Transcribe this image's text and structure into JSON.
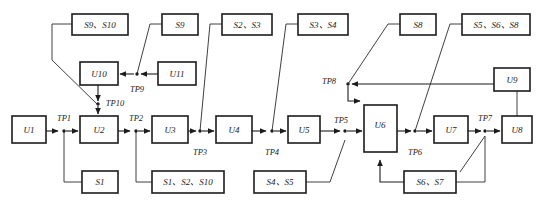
{
  "diagram": {
    "stroke_color": "#1c1c1c",
    "background_color": "#ffffff",
    "width": 544,
    "height": 209,
    "boxes": [
      {
        "id": "b_s9s10",
        "label": "S9、S10",
        "x": 72,
        "y": 14,
        "w": 56,
        "h": 21
      },
      {
        "id": "b_s9",
        "label": "S9",
        "x": 162,
        "y": 14,
        "w": 36,
        "h": 21
      },
      {
        "id": "b_s2s3",
        "label": "S2、S3",
        "x": 222,
        "y": 14,
        "w": 50,
        "h": 21
      },
      {
        "id": "b_s3s4",
        "label": "S3、S4",
        "x": 298,
        "y": 14,
        "w": 50,
        "h": 21
      },
      {
        "id": "b_s8",
        "label": "S8",
        "x": 400,
        "y": 14,
        "w": 36,
        "h": 21
      },
      {
        "id": "b_s5s6s8",
        "label": "S5、S6、S8",
        "x": 462,
        "y": 14,
        "w": 68,
        "h": 21
      },
      {
        "id": "b_u10",
        "label": "U10",
        "x": 80,
        "y": 62,
        "w": 38,
        "h": 23
      },
      {
        "id": "b_u11",
        "label": "U11",
        "x": 158,
        "y": 62,
        "w": 38,
        "h": 23
      },
      {
        "id": "b_u9",
        "label": "U9",
        "x": 494,
        "y": 68,
        "w": 36,
        "h": 23
      },
      {
        "id": "b_u1",
        "label": "U1",
        "x": 12,
        "y": 116,
        "w": 34,
        "h": 27
      },
      {
        "id": "b_u2",
        "label": "U2",
        "x": 80,
        "y": 116,
        "w": 38,
        "h": 27
      },
      {
        "id": "b_u3",
        "label": "U3",
        "x": 152,
        "y": 116,
        "w": 36,
        "h": 27
      },
      {
        "id": "b_u4",
        "label": "U4",
        "x": 216,
        "y": 116,
        "w": 36,
        "h": 27
      },
      {
        "id": "b_u5",
        "label": "U5",
        "x": 288,
        "y": 116,
        "w": 32,
        "h": 27
      },
      {
        "id": "b_u6",
        "label": "U6",
        "x": 364,
        "y": 105,
        "w": 33,
        "h": 47
      },
      {
        "id": "b_u7",
        "label": "U7",
        "x": 434,
        "y": 116,
        "w": 34,
        "h": 27
      },
      {
        "id": "b_u8",
        "label": "U8",
        "x": 502,
        "y": 116,
        "w": 30,
        "h": 27
      },
      {
        "id": "b_s1",
        "label": "S1",
        "x": 82,
        "y": 171,
        "w": 36,
        "h": 22
      },
      {
        "id": "b_s1s2s10",
        "label": "S1、S2、S10",
        "x": 152,
        "y": 171,
        "w": 72,
        "h": 22
      },
      {
        "id": "b_s4s5",
        "label": "S4、S5",
        "x": 254,
        "y": 171,
        "w": 52,
        "h": 22
      },
      {
        "id": "b_s6s7",
        "label": "S6、S7",
        "x": 404,
        "y": 171,
        "w": 52,
        "h": 22
      }
    ],
    "testpoints": [
      {
        "id": "tp1",
        "label": "TP1",
        "x": 64,
        "y": 119,
        "dot_x": 64,
        "dot_y": 131
      },
      {
        "id": "tp2",
        "label": "TP2",
        "x": 136,
        "y": 119,
        "dot_x": 136,
        "dot_y": 131
      },
      {
        "id": "tp3",
        "label": "TP3",
        "x": 200,
        "y": 153,
        "dot_x": 200,
        "dot_y": 131
      },
      {
        "id": "tp4",
        "label": "TP4",
        "x": 272,
        "y": 153,
        "dot_x": 272,
        "dot_y": 131
      },
      {
        "id": "tp5",
        "label": "TP5",
        "x": 341,
        "y": 122,
        "dot_x": 345,
        "dot_y": 131
      },
      {
        "id": "tp6",
        "label": "TP6",
        "x": 415,
        "y": 153,
        "dot_x": 415,
        "dot_y": 131
      },
      {
        "id": "tp7",
        "label": "TP7",
        "x": 485,
        "y": 119,
        "dot_x": 485,
        "dot_y": 131
      },
      {
        "id": "tp8",
        "label": "TP8",
        "x": 329,
        "y": 82,
        "dot_x": 348,
        "dot_y": 84
      },
      {
        "id": "tp9",
        "label": "TP9",
        "x": 137,
        "y": 89,
        "dot_x": 137,
        "dot_y": 74
      },
      {
        "id": "tp10",
        "label": "TP10",
        "x": 113,
        "y": 104,
        "dot_x": 98,
        "dot_y": 105
      }
    ],
    "edges": [
      {
        "id": "e_u1_tp1",
        "from": "U1",
        "to": "TP1"
      },
      {
        "id": "e_tp1_u2",
        "from": "TP1",
        "to": "U2"
      },
      {
        "id": "e_u2_tp2",
        "from": "U2",
        "to": "TP2"
      },
      {
        "id": "e_tp2_u3",
        "from": "TP2",
        "to": "U3"
      },
      {
        "id": "e_u3_tp3",
        "from": "U3",
        "to": "TP3"
      },
      {
        "id": "e_tp3_u4",
        "from": "TP3",
        "to": "U4"
      },
      {
        "id": "e_u4_tp4",
        "from": "U4",
        "to": "TP4"
      },
      {
        "id": "e_tp4_u5",
        "from": "TP4",
        "to": "U5"
      },
      {
        "id": "e_u5_tp5",
        "from": "U5",
        "to": "TP5"
      },
      {
        "id": "e_tp5_u6",
        "from": "TP5",
        "to": "U6"
      },
      {
        "id": "e_u6_tp6",
        "from": "U6",
        "to": "TP6"
      },
      {
        "id": "e_tp6_u7",
        "from": "TP6",
        "to": "U7"
      },
      {
        "id": "e_u7_tp7",
        "from": "U7",
        "to": "TP7"
      },
      {
        "id": "e_tp7_u8",
        "from": "TP7",
        "to": "U8"
      },
      {
        "id": "e_s1_tp1",
        "from": "S1",
        "to": "TP1"
      },
      {
        "id": "e_s1s2s10_tp2",
        "from": "S1、S2、S10",
        "to": "TP2"
      },
      {
        "id": "e_s2s3_tp3",
        "from": "S2、S3",
        "to": "TP3"
      },
      {
        "id": "e_s3s4_tp4",
        "from": "S3、S4",
        "to": "TP4"
      },
      {
        "id": "e_s4s5_tp5",
        "from": "S4、S5",
        "to": "TP5"
      },
      {
        "id": "e_s5s6s8_tp6",
        "from": "S5、S6、S8",
        "to": "TP6"
      },
      {
        "id": "e_s8_tp8",
        "from": "S8",
        "to": "TP8"
      },
      {
        "id": "e_u9_tp8",
        "from": "U9",
        "to": "TP8"
      },
      {
        "id": "e_tp8_u6",
        "from": "TP8",
        "to": "U6"
      },
      {
        "id": "e_s9_tp9",
        "from": "S9",
        "to": "TP9"
      },
      {
        "id": "e_u11_tp9",
        "from": "U11",
        "to": "TP9"
      },
      {
        "id": "e_tp9_u10",
        "from": "TP9",
        "to": "U10"
      },
      {
        "id": "e_u10_tp10",
        "from": "U10",
        "to": "TP10"
      },
      {
        "id": "e_s9s10_tp10",
        "from": "S9、S10",
        "to": "TP10"
      },
      {
        "id": "e_tp10_u2",
        "from": "TP10",
        "to": "U2"
      },
      {
        "id": "e_s6s7_u6",
        "from": "S6、S7",
        "to": "U6"
      },
      {
        "id": "e_s6s7_tp7",
        "from": "S6、S7",
        "to": "TP7"
      },
      {
        "id": "e_u9_u8",
        "from": "U9",
        "to": "U8"
      }
    ]
  }
}
